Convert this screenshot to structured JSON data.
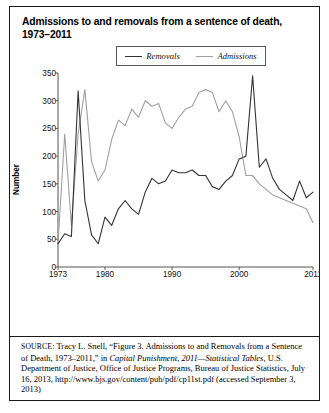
{
  "figure": {
    "title": "Admissions to and removals from a sentence of death, 1973–2011"
  },
  "legend": {
    "position": "top-center",
    "items": [
      {
        "label": "Removals",
        "color": "#333333"
      },
      {
        "label": "Admissions",
        "color": "#a0a0a0"
      }
    ]
  },
  "axes": {
    "ylabel": "Number",
    "yticks": [
      "0",
      "50",
      "100",
      "150",
      "200",
      "250",
      "300",
      "350"
    ],
    "xticks": [
      "1973",
      "1980",
      "1990",
      "2000",
      "2011"
    ]
  },
  "source": {
    "prefix": "SOURCE:",
    "part1": " Tracy L. Snell, “Figure 3. Admissions to and Removals from a Sentence of Death, 1973–2011,” in ",
    "italic1": "Capital Punishment, 2011—Statistical Tables",
    "part2": ", U.S. Department of Justice, Office of Justice Programs, Bureau of Justice Statistics, July 16, 2013, http://www.bjs.gov/content/pub/pdf/cp11st.pdf (accessed September 3, 2013)"
  },
  "chart_data": {
    "type": "line",
    "title": "Admissions to and removals from a sentence of death, 1973–2011",
    "xlabel": "",
    "ylabel": "Number",
    "xlim": [
      1973,
      2011
    ],
    "ylim": [
      0,
      350
    ],
    "grid": false,
    "legend_position": "top-center",
    "x": [
      1973,
      1974,
      1975,
      1976,
      1977,
      1978,
      1979,
      1980,
      1981,
      1982,
      1983,
      1984,
      1985,
      1986,
      1987,
      1988,
      1989,
      1990,
      1991,
      1992,
      1993,
      1994,
      1995,
      1996,
      1997,
      1998,
      1999,
      2000,
      2001,
      2002,
      2003,
      2004,
      2005,
      2006,
      2007,
      2008,
      2009,
      2010,
      2011
    ],
    "series": [
      {
        "name": "Removals",
        "color": "#333333",
        "values": [
          42,
          60,
          55,
          318,
          120,
          58,
          42,
          90,
          75,
          105,
          120,
          105,
          95,
          135,
          160,
          150,
          155,
          175,
          170,
          170,
          175,
          165,
          165,
          145,
          140,
          155,
          165,
          195,
          200,
          345,
          180,
          195,
          160,
          140,
          130,
          120,
          155,
          125,
          135
        ]
      },
      {
        "name": "Admissions",
        "color": "#a0a0a0",
        "values": [
          42,
          240,
          75,
          240,
          320,
          190,
          155,
          175,
          230,
          265,
          255,
          285,
          270,
          300,
          290,
          295,
          260,
          250,
          270,
          285,
          290,
          315,
          320,
          315,
          280,
          300,
          280,
          235,
          165,
          165,
          150,
          140,
          130,
          125,
          120,
          115,
          110,
          105,
          80
        ]
      }
    ],
    "annotations": [
      {
        "text": "Removals peak 1976 (~318)",
        "x": 1976,
        "y": 318
      },
      {
        "text": "Removals peak 2002 (~345)",
        "x": 2002,
        "y": 345
      },
      {
        "text": "Admissions peak 1977 (~320) and mid-1990s (~320)",
        "x": 1995,
        "y": 320
      }
    ]
  }
}
